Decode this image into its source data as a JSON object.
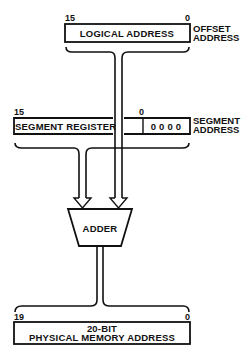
{
  "diagram": {
    "logical_address": {
      "label": "LOGICAL ADDRESS",
      "bit_high": "15",
      "bit_low": "0",
      "side_label_line1": "OFFSET",
      "side_label_line2": "ADDRESS"
    },
    "segment_register": {
      "label": "SEGMENT REGISTER",
      "padding_bits": "0 0 0 0",
      "bit_high": "15",
      "bit_low": "0",
      "side_label_line1": "SEGMENT",
      "side_label_line2": "ADDRESS"
    },
    "adder": {
      "label": "ADDER"
    },
    "physical_address": {
      "label_line1": "20-BIT",
      "label_line2": "PHYSICAL MEMORY ADDRESS",
      "bit_high": "19",
      "bit_low": "0"
    },
    "colors": {
      "ink": "#111111",
      "background": "#ffffff"
    }
  }
}
